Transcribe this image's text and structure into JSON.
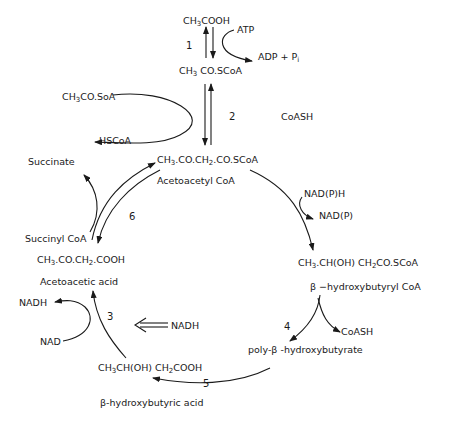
{
  "compounds": {
    "acetate": {
      "pre": "CH",
      "sub1": "3",
      "post": "COOH"
    },
    "acetyl_coa": {
      "pre": "CH",
      "sub1": "3",
      "post": " CO.SCoA"
    },
    "acetyl_coa_side": {
      "pre": "CH",
      "sub1": "3",
      "post": "CO.SoA"
    },
    "acetoacetyl_coa": {
      "pre": "CH",
      "sub1": "3",
      "mid": ".CO.CH",
      "sub2": "2",
      "post": ".CO.SCoA"
    },
    "acetoacetyl_coa_name": "Acetoacetyl  CoA",
    "hydroxybutyryl_coa": {
      "pre": "CH",
      "sub1": "3",
      "mid": ".CH(OH)  CH",
      "sub2": "2",
      "post": "CO.SCoA"
    },
    "hydroxybutyryl_coa_name": "β −hydroxybutyryl  CoA",
    "phb": "poly-β -hydroxybutyrate",
    "hydroxybutyric_acid": {
      "pre": "CH",
      "sub1": "3",
      "mid": "CH(OH) CH",
      "sub2": "2",
      "post": "COOH"
    },
    "hydroxybutyric_acid_name": "β-hydroxybutyric  acid",
    "acetoacetic_acid": {
      "pre": "CH",
      "sub1": "3",
      "mid": ".CO.CH",
      "sub2": "2",
      "post": ".COOH"
    },
    "acetoacetic_acid_name": "Acetoacetic  acid",
    "succinyl_coa": "Succinyl CoA",
    "succinate": "Succinate"
  },
  "cofactors": {
    "atp": "ATP",
    "adp_pi": "ADP  +  P",
    "adp_pi_sub": "i",
    "hscoa": "HSCoA",
    "coash_2": "CoASH",
    "nadph": "NAD(P)H",
    "nadp": "NAD(P)",
    "coash_4": "CoASH",
    "nadh_inhib": "NADH",
    "nadh_3": "NADH",
    "nad_3": "NAD"
  },
  "steps": [
    "1",
    "2",
    "3",
    "4",
    "5",
    "6"
  ]
}
